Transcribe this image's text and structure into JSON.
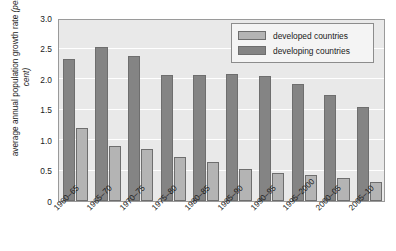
{
  "chart_data": {
    "type": "bar",
    "title": "",
    "xlabel": "",
    "ylabel": "average annual population growth rate (per cent)",
    "ylabel_main": "average annual population growth rate ",
    "ylabel_unit": "(per cent)",
    "ylim": [
      0,
      3.0
    ],
    "y_ticks": [
      "0",
      "0.5",
      "1.0",
      "1.5",
      "2.0",
      "2.5",
      "3.0"
    ],
    "y_tick_values": [
      0,
      0.5,
      1.0,
      1.5,
      2.0,
      2.5,
      3.0
    ],
    "grid": true,
    "legend_position": "top-right",
    "categories": [
      "1960–65",
      "1965–70",
      "1970–75",
      "1975–80",
      "1980–85",
      "1985–90",
      "1990–95",
      "1995–2000",
      "2000–05",
      "2005–10"
    ],
    "series": [
      {
        "name": "developing countries",
        "color": "#848484",
        "values": [
          2.33,
          2.52,
          2.37,
          2.07,
          2.07,
          2.08,
          2.05,
          1.92,
          1.73,
          1.54
        ]
      },
      {
        "name": "developed countries",
        "color": "#b4b4b4",
        "values": [
          1.19,
          0.9,
          0.85,
          0.72,
          0.64,
          0.52,
          0.46,
          0.43,
          0.38,
          0.31
        ]
      }
    ]
  },
  "legend": {
    "entries": [
      {
        "label": "developed countries",
        "color": "#b4b4b4"
      },
      {
        "label": "developing countries",
        "color": "#848484"
      }
    ]
  },
  "colors": {
    "plot_background": "#e9e9e9",
    "gridline": "#ffffff",
    "axis": "#9a9a9a",
    "bar_border": "#6e6e6e",
    "text": "#1a1a1a",
    "legend_background": "#f4f4f4"
  }
}
